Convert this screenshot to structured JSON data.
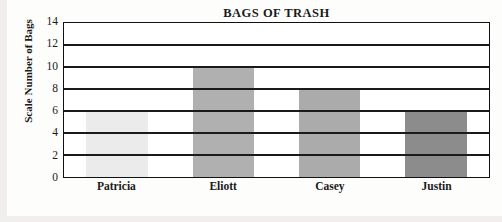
{
  "chart_data": {
    "type": "bar",
    "title": "BAGS OF TRASH",
    "xlabel": "",
    "ylabel_lines": [
      "Scale",
      "Number of Bags"
    ],
    "ylabel": "Scale Number of Bags",
    "categories": [
      "Patricia",
      "Eliott",
      "Casey",
      "Justin"
    ],
    "values": [
      6,
      10,
      8,
      6
    ],
    "bar_colors": [
      "#ebebeb",
      "#b0b0b0",
      "#ababab",
      "#8c8c8c"
    ],
    "ylim": [
      0,
      14
    ],
    "ytick_step": 2,
    "yticks": [
      0,
      2,
      4,
      6,
      8,
      10,
      12,
      14
    ],
    "ytick_labels": [
      "0",
      "2",
      "4",
      "6",
      "8",
      "10",
      "12",
      "14"
    ],
    "grid": true,
    "grid_axis": "y",
    "legend": false,
    "frame": true,
    "frame_color": "#111111",
    "background": "#ffffff"
  }
}
